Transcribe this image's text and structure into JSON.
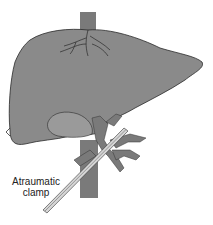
{
  "figure": {
    "labels": {
      "clamp_line1": "Atraumatic",
      "clamp_line2": "clamp"
    },
    "colors": {
      "liver": "#8a8a8a",
      "liver_outline": "#2a2a2a",
      "vessel": "#7a7a7a",
      "gallbladder": "#9a9a9a",
      "clamp": "#cfcfcf",
      "background": "#ffffff"
    }
  }
}
